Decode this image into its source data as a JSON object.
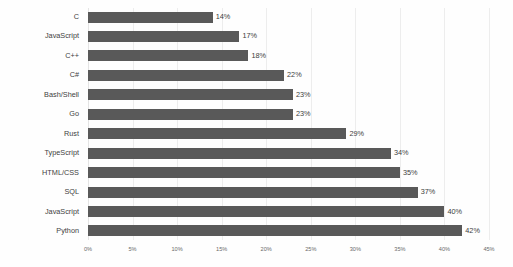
{
  "chart_data": {
    "type": "bar",
    "orientation": "horizontal",
    "title": "",
    "subtitle": "",
    "xlabel": "",
    "ylabel": "",
    "categories": [
      "C",
      "JavaScript",
      "C++",
      "C#",
      "Bash/Shell",
      "Go",
      "Rust",
      "TypeScript",
      "HTML/CSS",
      "SQL",
      "JavaScript",
      "Python"
    ],
    "values": [
      14,
      17,
      18,
      22,
      23,
      23,
      29,
      34,
      35,
      37,
      40,
      42
    ],
    "value_labels": [
      "14%",
      "17%",
      "18%",
      "22%",
      "23%",
      "23%",
      "29%",
      "34%",
      "35%",
      "37%",
      "40%",
      "42%"
    ],
    "xlim": [
      0,
      45
    ],
    "xticks": [
      0,
      5,
      10,
      15,
      20,
      25,
      30,
      35,
      40,
      45
    ],
    "xtick_labels": [
      "0%",
      "5%",
      "10%",
      "15%",
      "20%",
      "25%",
      "30%",
      "35%",
      "40%",
      "45%"
    ],
    "grid": true,
    "grid_axis": "x",
    "legend": false,
    "legend_position": "none",
    "bar_color": "#595959",
    "grid_color": "#ededed",
    "background_color": "#fefefe",
    "text_color": "#3d3d3d",
    "tick_color": "#6a6a6a"
  }
}
